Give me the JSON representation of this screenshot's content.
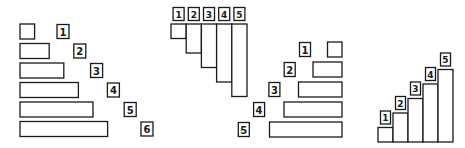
{
  "diagram": {
    "panels": [
      {
        "name": "horizontal-staircase-left-aligned",
        "orientation": "horizontal",
        "labels": [
          "1",
          "2",
          "3",
          "4",
          "5",
          "6"
        ],
        "lengths": [
          1,
          2,
          3,
          4,
          5,
          6
        ],
        "label_position": "right-diagonal"
      },
      {
        "name": "vertical-hanging-staircase",
        "orientation": "vertical-down",
        "labels": [
          "1",
          "2",
          "3",
          "4",
          "5"
        ],
        "lengths": [
          1,
          2,
          3,
          4,
          5
        ],
        "label_position": "top-row"
      },
      {
        "name": "horizontal-staircase-right-aligned",
        "orientation": "horizontal-right",
        "labels": [
          "1",
          "2",
          "3",
          "4",
          "5"
        ],
        "lengths": [
          1,
          2,
          3,
          4,
          5
        ],
        "label_position": "left-diagonal"
      },
      {
        "name": "vertical-rising-staircase",
        "orientation": "vertical-up",
        "labels": [
          "1",
          "2",
          "3",
          "4",
          "5"
        ],
        "lengths": [
          1,
          2,
          3,
          4,
          5
        ],
        "label_position": "above-each"
      }
    ],
    "colors": {
      "stroke": "#1a1a1a",
      "fill": "#ffffff"
    }
  }
}
